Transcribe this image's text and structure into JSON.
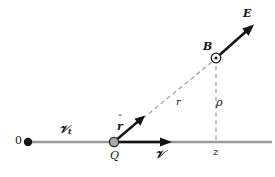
{
  "figure": {
    "type": "physics-vector-diagram",
    "background_color": "#ffffff",
    "axis_color": "#9a9a9a",
    "vector_color": "#141414",
    "dashed_color": "#9a9a9a",
    "charge_fill": "#a8a8a8"
  },
  "labels": {
    "origin": "0",
    "vt": "Ⅵ",
    "vt_base": "𝒱",
    "vt_sub": "t",
    "charge": "Q",
    "velocity": "𝒱",
    "r_hat_symbol": "r",
    "r_hat_accent": "ˆ",
    "distance_r": "r",
    "rho": "ρ",
    "z": "z",
    "b_field": "B",
    "e_field": "E"
  },
  "geometry": {
    "axis_y": 142,
    "axis_x_start": 28,
    "axis_x_end": 272,
    "origin_point": [
      28,
      142
    ],
    "charge_point": [
      114,
      142
    ],
    "field_point": [
      216,
      58
    ],
    "foot_point": [
      216,
      142
    ],
    "velocity_arrow_end": [
      171,
      142
    ],
    "r_hat_arrow_end": [
      144,
      116
    ],
    "e_arrow_end": [
      254,
      24
    ]
  },
  "icons": {
    "origin_dot": "filled-circle",
    "charge_marker": "gray-filled-circle",
    "b_marker": "circle-with-center-dot-out-of-page"
  }
}
